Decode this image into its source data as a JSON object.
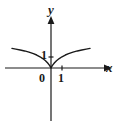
{
  "figure": {
    "background_color": "#ffffff",
    "stroke_color": "#1a1a1a",
    "labels": {
      "y_axis": "y",
      "x_axis": "x",
      "origin": "0",
      "x_tick_one": "1",
      "y_tick_one": "1"
    }
  },
  "chart_data": {
    "type": "line",
    "title": "",
    "xlabel": "x",
    "ylabel": "y",
    "grid": false,
    "legend": null,
    "axis_arrows": {
      "x": "right",
      "y": "up"
    },
    "xlim": [
      -3.6,
      4.4
    ],
    "ylim": [
      -4.6,
      4.4
    ],
    "xticks": [
      0,
      1
    ],
    "xticklabels": [
      "0",
      "1"
    ],
    "yticks": [
      1
    ],
    "yticklabels": [
      "1"
    ],
    "annotations": [
      {
        "text": "0",
        "x": 0,
        "y": 0,
        "position": "below-left-of-origin"
      },
      {
        "text": "1",
        "x": 1,
        "y": 0,
        "position": "below-x-tick"
      },
      {
        "text": "1",
        "x": 0,
        "y": 1,
        "position": "left-of-y-tick"
      }
    ],
    "series": [
      {
        "name": "curve",
        "description": "symmetric curve through the origin rising on both sides, cusp-like minimum at (0,0)",
        "x": [
          -3.55,
          -3.2,
          -2.8,
          -2.4,
          -2.0,
          -1.6,
          -1.3,
          -1.0,
          -0.75,
          -0.5,
          -0.3,
          -0.15,
          -0.05,
          0,
          0.05,
          0.15,
          0.3,
          0.5,
          0.75,
          1.0,
          1.3,
          1.6,
          2.0,
          2.4,
          2.8,
          3.2,
          3.55
        ],
        "y": [
          1.78,
          1.72,
          1.64,
          1.55,
          1.44,
          1.3,
          1.18,
          1.02,
          0.86,
          0.66,
          0.45,
          0.26,
          0.1,
          0,
          0.1,
          0.26,
          0.45,
          0.66,
          0.86,
          1.02,
          1.18,
          1.3,
          1.44,
          1.55,
          1.64,
          1.72,
          1.78
        ]
      }
    ]
  }
}
